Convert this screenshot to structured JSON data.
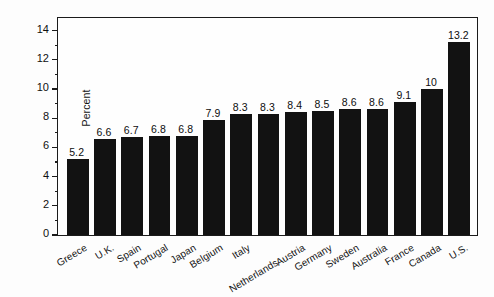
{
  "chart_data": {
    "type": "bar",
    "title": "",
    "subtitle": "",
    "xlabel": "",
    "ylabel": "Percent",
    "ylim": [
      0,
      15
    ],
    "ytick_values": [
      0,
      2,
      4,
      6,
      8,
      10,
      12,
      14
    ],
    "ytick_labels": [
      "0",
      "2",
      "4",
      "6",
      "8",
      "10",
      "12",
      "14"
    ],
    "yminor_values": [
      1,
      3,
      5,
      7,
      9,
      11,
      13
    ],
    "grid": false,
    "legend": null,
    "bar_color": "#121212",
    "categories": [
      "Greece",
      "U.K.",
      "Spain",
      "Portugal",
      "Japan",
      "Belgium",
      "Italy",
      "Netherlands",
      "Austria",
      "Germany",
      "Sweden",
      "Australia",
      "France",
      "Canada",
      "U.S."
    ],
    "values": [
      5.2,
      6.6,
      6.7,
      6.8,
      6.8,
      7.9,
      8.3,
      8.3,
      8.4,
      8.5,
      8.6,
      8.6,
      9.1,
      10,
      13.2
    ],
    "value_labels": [
      "5.2",
      "6.6",
      "6.7",
      "6.8",
      "6.8",
      "7.9",
      "8.3",
      "8.3",
      "8.4",
      "8.5",
      "8.6",
      "8.6",
      "9.1",
      "10",
      "13.2"
    ],
    "staggered_labels": [
      "Netherlands"
    ]
  }
}
